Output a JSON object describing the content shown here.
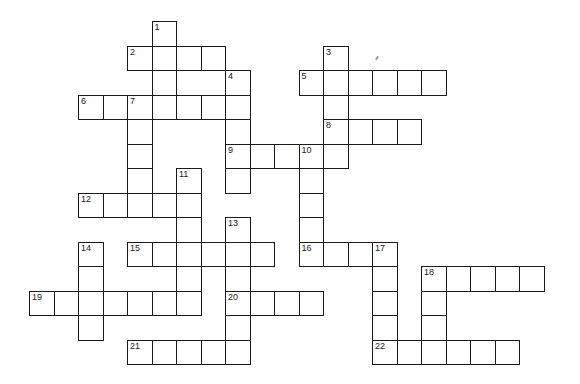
{
  "puzzle": {
    "type": "crossword",
    "cell_size": 24.5,
    "origin": {
      "x": 29,
      "y": 21
    },
    "line_color": "#1a1a1a",
    "background": "#ffffff",
    "clues": [
      {
        "number": 1,
        "direction": "down",
        "col": 5,
        "row": 0,
        "length": 4
      },
      {
        "number": 2,
        "direction": "across",
        "col": 4,
        "row": 1,
        "length": 4
      },
      {
        "number": 3,
        "direction": "down",
        "col": 12,
        "row": 1,
        "length": 5
      },
      {
        "number": 4,
        "direction": "down",
        "col": 8,
        "row": 2,
        "length": 5
      },
      {
        "number": 5,
        "direction": "across",
        "col": 11,
        "row": 2,
        "length": 6
      },
      {
        "number": 6,
        "direction": "across",
        "col": 2,
        "row": 3,
        "length": 7
      },
      {
        "number": 7,
        "direction": "down",
        "col": 4,
        "row": 3,
        "length": 5
      },
      {
        "number": 8,
        "direction": "across",
        "col": 12,
        "row": 4,
        "length": 4
      },
      {
        "number": 9,
        "direction": "across",
        "col": 8,
        "row": 5,
        "length": 5
      },
      {
        "number": 10,
        "direction": "down",
        "col": 11,
        "row": 5,
        "length": 5
      },
      {
        "number": 11,
        "direction": "down",
        "col": 6,
        "row": 6,
        "length": 6
      },
      {
        "number": 12,
        "direction": "across",
        "col": 2,
        "row": 7,
        "length": 5
      },
      {
        "number": 13,
        "direction": "down",
        "col": 8,
        "row": 8,
        "length": 6
      },
      {
        "number": 14,
        "direction": "down",
        "col": 2,
        "row": 9,
        "length": 4
      },
      {
        "number": 15,
        "direction": "across",
        "col": 4,
        "row": 9,
        "length": 6
      },
      {
        "number": 16,
        "direction": "across",
        "col": 11,
        "row": 9,
        "length": 4
      },
      {
        "number": 17,
        "direction": "down",
        "col": 14,
        "row": 9,
        "length": 5
      },
      {
        "number": 18,
        "direction": "across",
        "col": 16,
        "row": 10,
        "length": 5
      },
      {
        "number": 18,
        "direction": "down",
        "col": 16,
        "row": 10,
        "length": 4
      },
      {
        "number": 19,
        "direction": "across",
        "col": 0,
        "row": 11,
        "length": 7
      },
      {
        "number": 20,
        "direction": "across",
        "col": 8,
        "row": 11,
        "length": 4
      },
      {
        "number": 21,
        "direction": "across",
        "col": 4,
        "row": 13,
        "length": 5
      },
      {
        "number": 22,
        "direction": "across",
        "col": 14,
        "row": 13,
        "length": 6
      }
    ]
  }
}
